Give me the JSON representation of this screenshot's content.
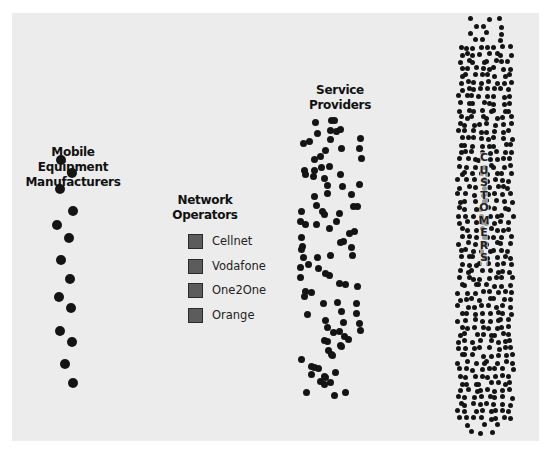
{
  "diagram": {
    "groups": {
      "manufacturers": {
        "label_line1": "Mobile Equipment",
        "label_line2": "Manufacturers"
      },
      "operators": {
        "label_line1": "Network",
        "label_line2": "Operators",
        "items": [
          {
            "label": "Cellnet"
          },
          {
            "label": "Vodafone"
          },
          {
            "label": "One2One"
          },
          {
            "label": "Orange"
          }
        ]
      },
      "providers": {
        "label_line1": "Service",
        "label_line2": "Providers"
      },
      "customers": {
        "label": "CUSTOMERS",
        "letters": [
          "C",
          "U",
          "S",
          "T",
          "O",
          "M",
          "E",
          "R",
          "S"
        ]
      }
    },
    "colors": {
      "background": "#ececec",
      "dot": "#141414",
      "swatch": "#5c5c5c"
    }
  }
}
